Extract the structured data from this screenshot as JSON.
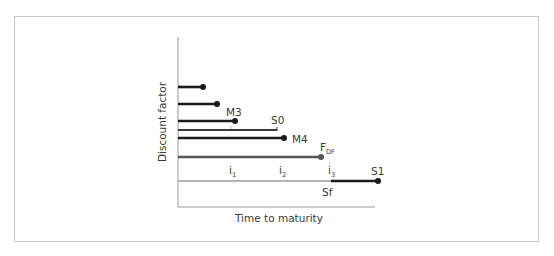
{
  "diagram": {
    "axes": {
      "y_label": "Discount factor",
      "x_label": "Time to maturity"
    },
    "lines": [
      {
        "id": "line-1",
        "label": "",
        "y": 87,
        "x_end": 203,
        "color": "#1a1a1a",
        "end": "dot"
      },
      {
        "id": "line-2",
        "label": "",
        "y": 104,
        "x_end": 217,
        "color": "#1a1a1a",
        "end": "dot"
      },
      {
        "id": "line-m3",
        "label": "M3",
        "y": 121,
        "x_end": 235,
        "color": "#1a1a1a",
        "end": "dot"
      },
      {
        "id": "line-s0",
        "label": "S0",
        "y": 130,
        "x_end": 277,
        "color": "#3a3a3a",
        "end": "tick"
      },
      {
        "id": "line-m4",
        "label": "M4",
        "y": 138,
        "x_end": 284,
        "color": "#1a1a1a",
        "end": "dot"
      },
      {
        "id": "line-fdf",
        "label": "F",
        "label_sub": "DF",
        "y": 157,
        "x_end": 321,
        "color": "#555555",
        "end": "dot"
      },
      {
        "id": "line-sf",
        "label": "Sf",
        "y": 181,
        "x_end": 331,
        "color": "#b4b4b4",
        "end": "none"
      },
      {
        "id": "line-s1",
        "label": "S1",
        "y": 181,
        "x_start": 331,
        "x_end": 378,
        "color": "#1a1a1a",
        "end": "dot"
      }
    ],
    "interval_marks": [
      {
        "label": "i",
        "sub": "1",
        "x": 231
      },
      {
        "label": "i",
        "sub": "2",
        "x": 281
      },
      {
        "label": "i",
        "sub": "3",
        "x": 330
      }
    ],
    "labels": {
      "m3": "M3",
      "s0": "S0",
      "m4": "M4",
      "fdf": "F",
      "fdf_sub": "DF",
      "s1": "S1",
      "sf": "Sf",
      "i": "i",
      "i1_sub": "1",
      "i2_sub": "2",
      "i3_sub": "3"
    },
    "colors": {
      "black_line": "#1a1a1a",
      "dark_gray_line": "#555555",
      "light_gray_line": "#b4b4b4",
      "axis": "#9a9a9a",
      "frame": "#c8c8c8"
    }
  }
}
